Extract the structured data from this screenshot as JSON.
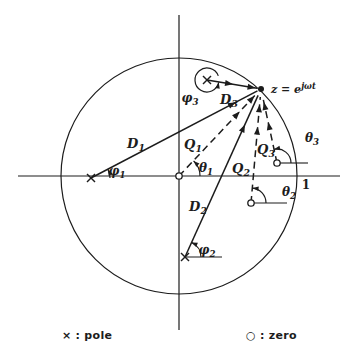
{
  "figure": {
    "background": "#ffffff",
    "ink": "#1c1c1c",
    "width": 351,
    "height": 357
  },
  "legend": {
    "pole": {
      "symbol": "×",
      "label": ": pole"
    },
    "zero": {
      "symbol": "○",
      "label": ": zero"
    }
  },
  "diagram": {
    "origin": [
      179,
      176
    ],
    "unit_circle_radius": 118,
    "z_point": [
      261,
      89
    ],
    "axes": {
      "horizontal": [
        18,
        176,
        340,
        176
      ],
      "vertical": [
        179,
        15,
        179,
        330
      ]
    },
    "poles": [
      {
        "name": "pole-1",
        "at": [
          91,
          178
        ]
      },
      {
        "name": "pole-2",
        "at": [
          185,
          257
        ]
      },
      {
        "name": "pole-3",
        "at": [
          207,
          80
        ]
      }
    ],
    "zeros": [
      {
        "name": "zero-1",
        "at": [
          179,
          176
        ]
      },
      {
        "name": "zero-2",
        "at": [
          251,
          203
        ]
      },
      {
        "name": "zero-3",
        "at": [
          277,
          163
        ]
      }
    ],
    "vectors": [
      {
        "name": "vector-D1",
        "style": "solid",
        "from": [
          91,
          178
        ],
        "shorten": 4,
        "arrows": [
          0.87
        ]
      },
      {
        "name": "vector-D2",
        "style": "solid",
        "from": [
          185,
          257
        ],
        "shorten": 7,
        "arrows": [
          0.82
        ]
      },
      {
        "name": "vector-D3",
        "style": "solid",
        "from": [
          207,
          80
        ],
        "shorten": 4,
        "arrows": [
          0.52,
          0.97
        ]
      },
      {
        "name": "vector-Q1",
        "style": "dashed",
        "from": [
          179,
          176
        ],
        "shorten": 6,
        "arrows": [
          0.78,
          0.97
        ]
      },
      {
        "name": "vector-Q2",
        "style": "dashed",
        "from": [
          251,
          203
        ],
        "shorten": 8,
        "arrows": [
          0.72,
          0.93
        ]
      },
      {
        "name": "vector-Q3",
        "style": "dashed",
        "from": [
          277,
          163
        ],
        "shorten": 8,
        "arrows": [
          0.62,
          0.92
        ]
      }
    ],
    "angle_arcs": [
      {
        "name": "arc-phi1",
        "center": [
          91,
          178
        ],
        "radius": 19,
        "start": 0,
        "end": 27
      },
      {
        "name": "arc-theta1",
        "center": [
          179,
          176
        ],
        "radius": 21,
        "start": 0,
        "end": 46
      },
      {
        "name": "arc-phi2",
        "center": [
          185,
          257
        ],
        "radius": 16,
        "start": 0,
        "end": 66,
        "ref_line": [
          222,
          257
        ]
      },
      {
        "name": "arc-theta2",
        "center": [
          251,
          203
        ],
        "radius": 15,
        "start": 0,
        "end": 84,
        "ref_line": [
          287,
          203
        ]
      },
      {
        "name": "arc-theta3",
        "center": [
          277,
          163
        ],
        "radius": 14,
        "start": 0,
        "end": 102,
        "ref_line": [
          308,
          163
        ]
      },
      {
        "name": "arc-phi3",
        "center": [
          207,
          80
        ],
        "radius": 12,
        "start": 20,
        "end": 348
      }
    ],
    "labels": [
      {
        "name": "label-D1",
        "base": "D",
        "sub": "1",
        "x": 136,
        "y": 148,
        "size": 13
      },
      {
        "name": "label-D2",
        "base": "D",
        "sub": "2",
        "x": 198,
        "y": 211,
        "size": 13
      },
      {
        "name": "label-D3",
        "base": "D",
        "sub": "3",
        "x": 229,
        "y": 104,
        "size": 13
      },
      {
        "name": "label-Q1",
        "base": "Q",
        "sub": "1",
        "x": 193,
        "y": 149,
        "size": 13
      },
      {
        "name": "label-Q2",
        "base": "Q",
        "sub": "2",
        "x": 241,
        "y": 173,
        "size": 13
      },
      {
        "name": "label-Q3",
        "base": "Q",
        "sub": "3",
        "x": 266,
        "y": 154,
        "size": 13
      },
      {
        "name": "label-phi1",
        "base": "φ",
        "sub": "1",
        "x": 117,
        "y": 175,
        "size": 12
      },
      {
        "name": "label-phi2",
        "base": "φ",
        "sub": "2",
        "x": 207,
        "y": 254,
        "size": 12
      },
      {
        "name": "label-phi3",
        "base": "φ",
        "sub": "3",
        "x": 190,
        "y": 102,
        "size": 12
      },
      {
        "name": "label-theta1",
        "base": "θ",
        "sub": "1",
        "x": 206,
        "y": 172,
        "size": 12
      },
      {
        "name": "label-theta2",
        "base": "θ",
        "sub": "2",
        "x": 289,
        "y": 196,
        "size": 12
      },
      {
        "name": "label-theta3",
        "base": "θ",
        "sub": "3",
        "x": 312,
        "y": 142,
        "size": 12
      },
      {
        "name": "label-z-point",
        "base": "z = e",
        "sup": "jωt",
        "x": 271,
        "y": 93,
        "size": 11,
        "anchor": "start"
      },
      {
        "name": "label-unit-radius",
        "base": "1",
        "x": 306,
        "y": 189,
        "size": 12,
        "italic": false
      }
    ]
  }
}
